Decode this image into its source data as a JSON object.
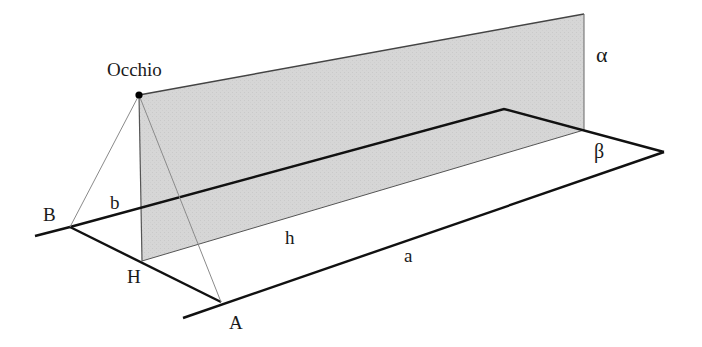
{
  "labels": {
    "eye": "Occhio",
    "alpha": "α",
    "beta": "β",
    "B": "B",
    "b": "b",
    "H": "H",
    "h": "h",
    "a": "a",
    "A": "A"
  },
  "colors": {
    "plane_fill": "#d4d4d4",
    "plane_edge": "#555555",
    "ground_line": "#111111",
    "sight_line": "#8a8a8a",
    "text": "#1a1a1a"
  }
}
